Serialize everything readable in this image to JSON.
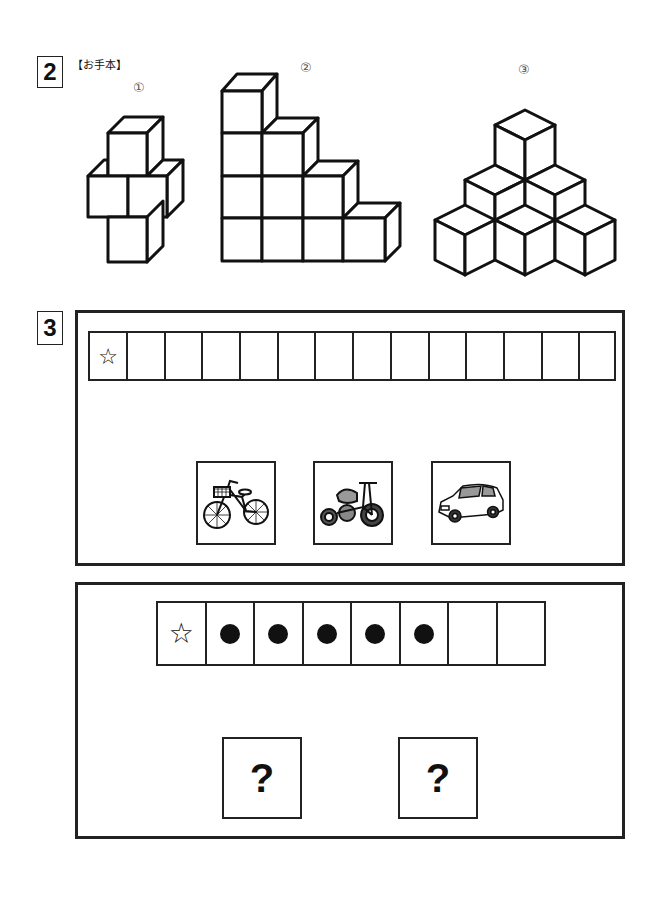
{
  "section2": {
    "number": "2",
    "label": "【お手本】",
    "figures": [
      {
        "id": "①",
        "description": "cross-shaped stack of 4 cubes"
      },
      {
        "id": "②",
        "description": "staircase of 10 cubes (4-3-2-1)"
      },
      {
        "id": "③",
        "description": "pyramid of 6 cubes (3-2-1)"
      }
    ]
  },
  "section3": {
    "number": "3",
    "panel1": {
      "row_cells": 14,
      "first_cell_symbol": "☆",
      "pictures": [
        {
          "name": "bicycle",
          "label": "bicycle"
        },
        {
          "name": "tricycle",
          "label": "tricycle"
        },
        {
          "name": "car",
          "label": "car"
        }
      ]
    },
    "panel2": {
      "row": [
        "☆",
        "●",
        "●",
        "●",
        "●",
        "●",
        "",
        ""
      ],
      "question_boxes": [
        "?",
        "?"
      ]
    }
  }
}
